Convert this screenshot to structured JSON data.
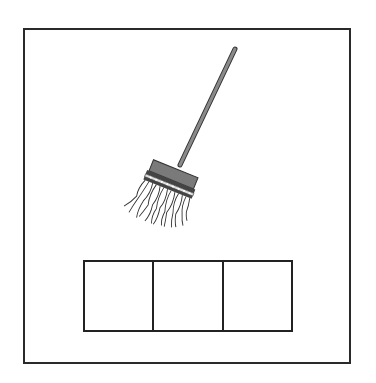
{
  "worksheet": {
    "picture": {
      "icon": "mop-icon",
      "word_length": 3
    },
    "letter_boxes": [
      {
        "value": ""
      },
      {
        "value": ""
      },
      {
        "value": ""
      }
    ],
    "colors": {
      "frame": "#2a2a2a",
      "handle": "#8a8a8a",
      "head": "#7a7a7a",
      "strands": "#ffffff",
      "outline": "#333333"
    }
  }
}
